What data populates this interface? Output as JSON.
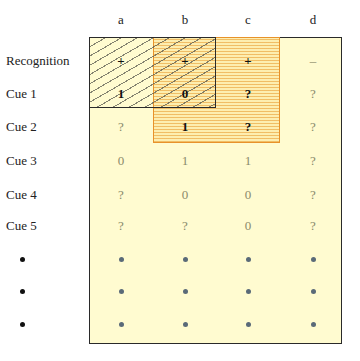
{
  "diagram": {
    "columns": [
      "a",
      "b",
      "c",
      "d"
    ],
    "rows": [
      {
        "label": "Recognition",
        "cells": [
          "+",
          "+",
          "+",
          "–"
        ],
        "styles": [
          "strong",
          "strong",
          "strong",
          "faint"
        ]
      },
      {
        "label": "Cue 1",
        "cells": [
          "1",
          "0",
          "?",
          "?"
        ],
        "styles": [
          "strong",
          "strong",
          "strong",
          "faint"
        ]
      },
      {
        "label": "Cue 2",
        "cells": [
          "?",
          "1",
          "?",
          "?"
        ],
        "styles": [
          "faint",
          "strong",
          "strong",
          "faint"
        ]
      },
      {
        "label": "Cue 3",
        "cells": [
          "0",
          "1",
          "1",
          "?"
        ],
        "styles": [
          "faint",
          "faint",
          "faint",
          "faint"
        ]
      },
      {
        "label": "Cue 4",
        "cells": [
          "?",
          "0",
          "0",
          "?"
        ],
        "styles": [
          "faint",
          "faint",
          "faint",
          "faint"
        ]
      },
      {
        "label": "Cue 5",
        "cells": [
          "?",
          "?",
          "0",
          "?"
        ],
        "styles": [
          "faint",
          "faint",
          "faint",
          "faint"
        ]
      },
      {
        "label": "•",
        "cells": [
          "•",
          "•",
          "•",
          "•"
        ]
      },
      {
        "label": "•",
        "cells": [
          "•",
          "•",
          "•",
          "•"
        ]
      },
      {
        "label": "•",
        "cells": [
          "•",
          "•",
          "•",
          "•"
        ]
      }
    ],
    "regions": {
      "hatched_black_box": {
        "columns": [
          "a",
          "b"
        ],
        "rows": [
          "Recognition",
          "Cue 1"
        ],
        "border_color": "#2a2a2a"
      },
      "dotted_orange_box": {
        "columns": [
          "b",
          "c"
        ],
        "rows": [
          "Recognition",
          "Cue 1",
          "Cue 2"
        ],
        "border_color": "#e8922a"
      },
      "outer_box": {
        "fill_color": "#fffbd0",
        "border_color": "#2a2a2a"
      }
    }
  }
}
